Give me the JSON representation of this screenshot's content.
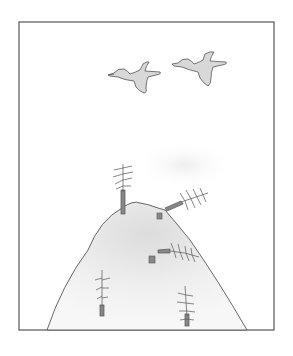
{
  "scene": {
    "description": "Pencil drawing of two ducks flying over a hill with bare, broken trees and stumps",
    "colors": {
      "background": "#ffffff",
      "frame": "#555555",
      "ink": "#444444",
      "duck_fill": "#d8d8d8",
      "hill_shade": "#e6e6e6",
      "trunk": "#888888"
    },
    "elements": {
      "ducks": 2,
      "standing_trees": 3,
      "fallen_trees": 2,
      "stumps": 2
    }
  }
}
